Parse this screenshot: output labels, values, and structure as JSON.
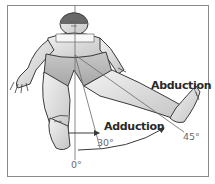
{
  "figure": {
    "labels": {
      "abduction": "Abduction",
      "adduction": "Adduction",
      "angle_zero": "0°",
      "angle_adduction": "30°",
      "angle_abduction": "45°"
    },
    "colors": {
      "frame": "#8a8a8a",
      "body_fill": "#dcdcdc",
      "body_shade": "#b8b8b8",
      "outline": "#3a3a3a",
      "text": "#2a2a2a",
      "angle_text": "#6a6a6a"
    }
  }
}
